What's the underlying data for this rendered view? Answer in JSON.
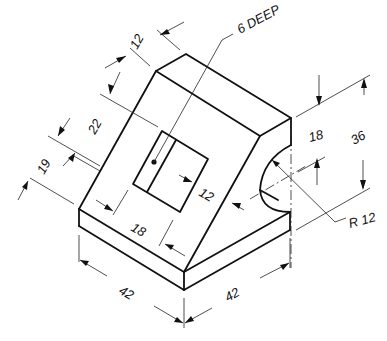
{
  "drawing": {
    "type": "isometric mechanical part drawing",
    "notes": {
      "pocket_depth": "6 DEEP"
    },
    "dimensions": {
      "top_width": "12",
      "slope_offset": "22",
      "base_height": "19",
      "pocket_width": "18",
      "pocket_height": "12",
      "base_length_left": "42",
      "base_length_right": "42",
      "total_height": "36",
      "arc_center_height": "18",
      "radius": "R 12"
    },
    "colors": {
      "line": "#111111",
      "background": "#ffffff"
    }
  }
}
